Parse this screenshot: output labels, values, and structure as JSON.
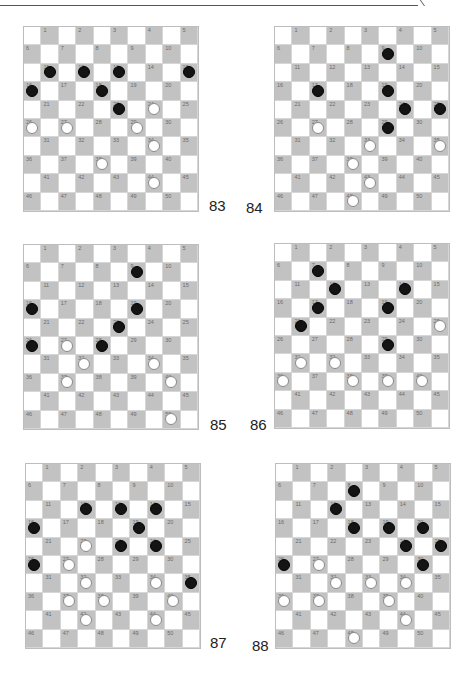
{
  "page": {
    "type": "checkers-puzzle-diagrams",
    "board_size": 10,
    "colors": {
      "dark_square": "#c2c2c2",
      "light_square": "#ffffff",
      "black_piece": "#141414",
      "white_piece": "#ffffff"
    }
  },
  "diagrams": [
    {
      "label": "83",
      "left": 23,
      "top": 26,
      "label_x": 209,
      "label_y": 197,
      "black": [
        11,
        12,
        13,
        15,
        16,
        18,
        23
      ],
      "white": [
        24,
        26,
        27,
        29,
        34,
        38,
        44
      ]
    },
    {
      "label": "84",
      "left": 274,
      "top": 26,
      "label_x": 246,
      "label_y": 199,
      "black": [
        9,
        17,
        19,
        24,
        25,
        29
      ],
      "white": [
        27,
        33,
        35,
        38,
        43,
        48
      ]
    },
    {
      "label": "85",
      "left": 23,
      "top": 244,
      "label_x": 210,
      "label_y": 416,
      "black": [
        9,
        16,
        19,
        23,
        26,
        28
      ],
      "white": [
        27,
        32,
        34,
        37,
        40,
        50
      ]
    },
    {
      "label": "86",
      "left": 274,
      "top": 243,
      "label_x": 250,
      "label_y": 416,
      "black": [
        7,
        12,
        14,
        17,
        19,
        21,
        29
      ],
      "white": [
        25,
        31,
        32,
        36,
        38,
        39,
        40
      ]
    },
    {
      "label": "87",
      "left": 25,
      "top": 463,
      "label_x": 210,
      "label_y": 634,
      "black": [
        12,
        13,
        14,
        16,
        19,
        23,
        24,
        26,
        35
      ],
      "white": [
        22,
        27,
        32,
        34,
        37,
        38,
        40,
        42,
        44
      ]
    },
    {
      "label": "88",
      "left": 275,
      "top": 463,
      "label_x": 252,
      "label_y": 637,
      "black": [
        8,
        12,
        18,
        19,
        20,
        24,
        25,
        26,
        30
      ],
      "white": [
        27,
        32,
        33,
        34,
        36,
        37,
        39,
        44,
        48
      ]
    }
  ]
}
